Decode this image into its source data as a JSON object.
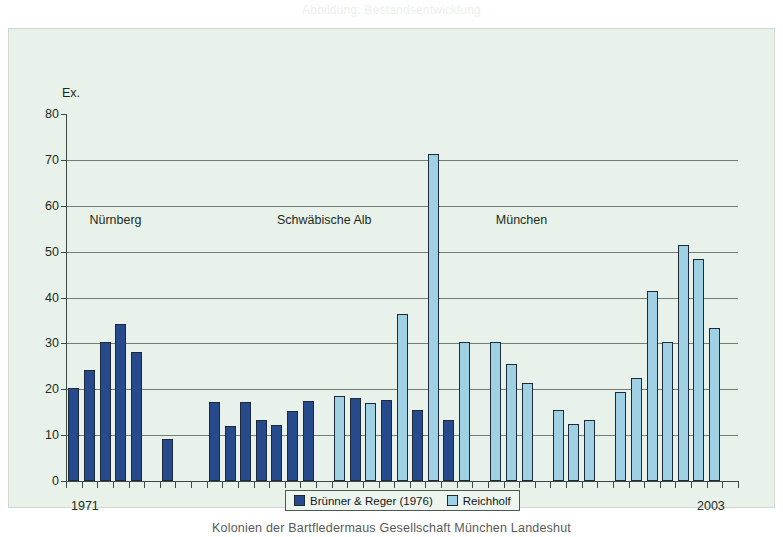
{
  "page": {
    "caption_top": "Abbildung: Bestandsentwicklung",
    "caption_bottom": "Kolonien der Bartfledermaus Gesellschaft München Landeshut"
  },
  "chart_data": {
    "type": "bar",
    "title": "",
    "xlabel": "",
    "ylabel": "Ex.",
    "ylim": [
      0,
      80
    ],
    "yticks": [
      0,
      10,
      20,
      30,
      40,
      50,
      60,
      70,
      80
    ],
    "grid": true,
    "legend_position": "bottom-center",
    "x_axis_labels": {
      "start": "1971",
      "end": "2003"
    },
    "region_annotations": [
      {
        "label": "Nürnberg",
        "x_index": 1
      },
      {
        "label": "Schwäbische Alb",
        "x_index": 13
      },
      {
        "label": "München",
        "x_index": 27
      }
    ],
    "series": [
      {
        "name": "Brünner & Reger (1976)",
        "color": "#274a8c"
      },
      {
        "name": "Reichholf",
        "color": "#9fd0e4"
      }
    ],
    "bars": [
      {
        "slot": 0,
        "series": "Brünner & Reger (1976)",
        "value": 20.2
      },
      {
        "slot": 1,
        "series": "Brünner & Reger (1976)",
        "value": 24.2
      },
      {
        "slot": 2,
        "series": "Brünner & Reger (1976)",
        "value": 30.2
      },
      {
        "slot": 3,
        "series": "Brünner & Reger (1976)",
        "value": 34.2
      },
      {
        "slot": 4,
        "series": "Brünner & Reger (1976)",
        "value": 28.2
      },
      {
        "slot": 6,
        "series": "Brünner & Reger (1976)",
        "value": 9.2
      },
      {
        "slot": 9,
        "series": "Brünner & Reger (1976)",
        "value": 17.2
      },
      {
        "slot": 10,
        "series": "Brünner & Reger (1976)",
        "value": 12.0
      },
      {
        "slot": 11,
        "series": "Brünner & Reger (1976)",
        "value": 17.2
      },
      {
        "slot": 12,
        "series": "Brünner & Reger (1976)",
        "value": 13.2
      },
      {
        "slot": 13,
        "series": "Brünner & Reger (1976)",
        "value": 12.2
      },
      {
        "slot": 14,
        "series": "Brünner & Reger (1976)",
        "value": 15.2
      },
      {
        "slot": 15,
        "series": "Brünner & Reger (1976)",
        "value": 17.5
      },
      {
        "slot": 17,
        "series": "Reichholf",
        "value": 18.5
      },
      {
        "slot": 18,
        "series": "Brünner & Reger (1976)",
        "value": 18.0
      },
      {
        "slot": 19,
        "series": "Reichholf",
        "value": 17.0
      },
      {
        "slot": 20,
        "series": "Brünner & Reger (1976)",
        "value": 17.6
      },
      {
        "slot": 21,
        "series": "Reichholf",
        "value": 36.3
      },
      {
        "slot": 22,
        "series": "Brünner & Reger (1976)",
        "value": 15.5
      },
      {
        "slot": 23,
        "series": "Reichholf",
        "value": 71.2
      },
      {
        "slot": 24,
        "series": "Brünner & Reger (1976)",
        "value": 13.2
      },
      {
        "slot": 25,
        "series": "Reichholf",
        "value": 30.4
      },
      {
        "slot": 27,
        "series": "Reichholf",
        "value": 30.4
      },
      {
        "slot": 28,
        "series": "Reichholf",
        "value": 25.4
      },
      {
        "slot": 29,
        "series": "Reichholf",
        "value": 21.4
      },
      {
        "slot": 31,
        "series": "Reichholf",
        "value": 15.4
      },
      {
        "slot": 32,
        "series": "Reichholf",
        "value": 12.5
      },
      {
        "slot": 33,
        "series": "Reichholf",
        "value": 13.4
      },
      {
        "slot": 35,
        "series": "Reichholf",
        "value": 19.4
      },
      {
        "slot": 36,
        "series": "Reichholf",
        "value": 22.5
      },
      {
        "slot": 37,
        "series": "Reichholf",
        "value": 41.5
      },
      {
        "slot": 38,
        "series": "Reichholf",
        "value": 30.4
      },
      {
        "slot": 39,
        "series": "Reichholf",
        "value": 51.5
      },
      {
        "slot": 40,
        "series": "Reichholf",
        "value": 48.5
      },
      {
        "slot": 41,
        "series": "Reichholf",
        "value": 33.4
      }
    ],
    "slot_count": 43
  }
}
